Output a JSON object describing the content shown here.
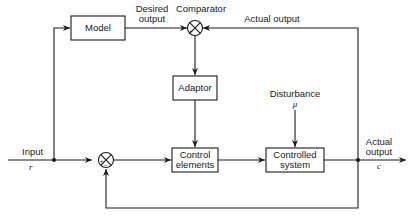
{
  "diagram": {
    "type": "block-diagram",
    "blocks": {
      "model": "Model",
      "adaptor": "Adaptor",
      "control_elements_line1": "Control",
      "control_elements_line2": "elements",
      "controlled_system_line1": "Controlled",
      "controlled_system_line2": "system"
    },
    "junctions": {
      "comparator": "Comparator",
      "comparator_sign": "+",
      "summing_sign_plus": "+",
      "summing_sign_minus": "−"
    },
    "signals": {
      "input": "Input",
      "input_symbol": "r",
      "desired_output_line1": "Desired",
      "desired_output_line2": "output",
      "actual_output_feedback": "Actual output",
      "disturbance": "Disturbance",
      "disturbance_symbol": "μ",
      "actual_output_line1": "Actual",
      "actual_output_line2": "output",
      "output_symbol": "c"
    },
    "colors": {
      "line": "#1a1a1a",
      "background": "#ffffff"
    }
  }
}
